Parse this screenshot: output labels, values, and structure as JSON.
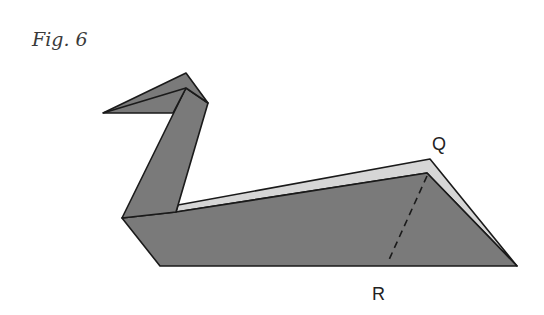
{
  "figure": {
    "title": "Fig. 6",
    "labels": {
      "q": "Q",
      "r": "R"
    },
    "colors": {
      "paper_dark": "#7a7a7a",
      "paper_light": "#d6d6d6",
      "outline": "#1a1a1a",
      "background": "#ffffff"
    }
  }
}
